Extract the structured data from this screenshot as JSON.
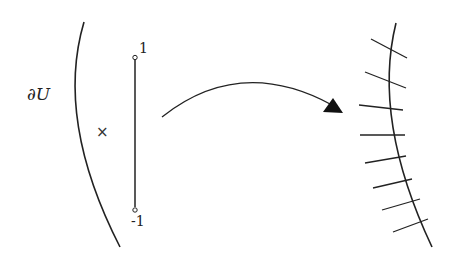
{
  "labels": {
    "boundary": "∂U",
    "point_marker": "×",
    "segment_top": "1",
    "segment_bottom": "-1"
  },
  "colors": {
    "stroke": "#222222",
    "background": "#ffffff"
  },
  "elements": {
    "left_arc": "boundary of U (arc)",
    "segment": "interval from -1 to 1 with open endpoints",
    "arrow": "curved mapping arrow",
    "right_curve": "image curve with transverse tick marks",
    "tick_count": 8
  }
}
